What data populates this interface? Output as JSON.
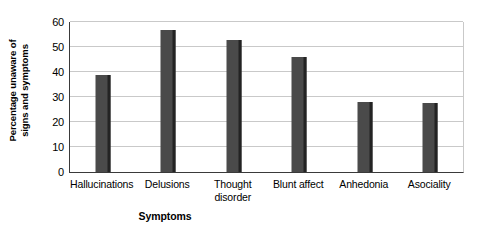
{
  "chart_data": {
    "type": "bar",
    "title": "",
    "categories": [
      "Hallucinations",
      "Delusions",
      "Thought\ndisorder",
      "Blunt affect",
      "Anhedonia",
      "Asociality"
    ],
    "values": [
      39,
      57,
      53,
      46,
      28,
      27.5
    ],
    "xlabel": "Symptoms",
    "ylabel": "Percentage unaware of signs and symptoms",
    "ylabel_line1": "Percentage unaware of",
    "ylabel_line2": "signs and symptoms",
    "ylim": [
      0,
      60
    ],
    "ytick_labels": [
      "0",
      "10",
      "20",
      "30",
      "40",
      "50",
      "60"
    ],
    "ytick_values": [
      0,
      10,
      20,
      30,
      40,
      50,
      60
    ],
    "grid": "horizontal",
    "legend": "none",
    "bar_color": "#4a4a4a",
    "bar_shadow_color": "#232323",
    "gridline_color": "#c9c9c9",
    "axis_color": "#3a3a3a"
  }
}
